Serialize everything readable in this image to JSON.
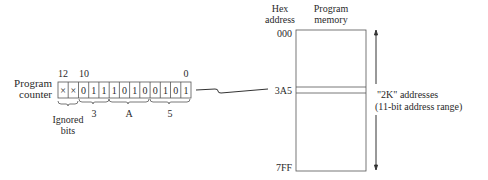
{
  "program_counter": {
    "label_line1": "Program",
    "label_line2": "counter",
    "bit_labels": {
      "high": "12",
      "mid": "10",
      "low": "0"
    },
    "bits": [
      "×",
      "×",
      "0",
      "1",
      "1",
      "1",
      "0",
      "1",
      "0",
      "0",
      "1",
      "0",
      "1"
    ],
    "hex_groups": [
      "3",
      "A",
      "5"
    ],
    "ignored_label_line1": "Ignored",
    "ignored_label_line2": "bits"
  },
  "memory": {
    "col_hex_line1": "Hex",
    "col_hex_line2": "address",
    "col_mem_line1": "Program",
    "col_mem_line2": "memory",
    "addr_start": "000",
    "addr_pointed": "3A5",
    "addr_end": "7FF"
  },
  "range": {
    "line1": "\"2K\" addresses",
    "line2": "(11-bit address range)"
  }
}
